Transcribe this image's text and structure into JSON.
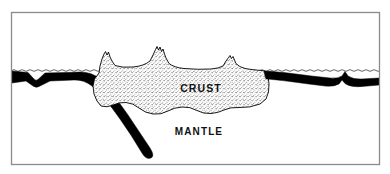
{
  "figure": {
    "background_color": "#ffffff",
    "frame": {
      "name": "outer-frame",
      "stroke_color": "#8a8a8a",
      "fill_color": "#ffffff",
      "x": 11,
      "y": 12,
      "width": 369,
      "height": 153
    },
    "labels": {
      "crust": "CRUST",
      "mantle": "MANTLE"
    },
    "sea_level": {
      "name": "sea-level-line",
      "y": 70,
      "style": "wavy",
      "color": "#444444"
    },
    "layers": {
      "crust": {
        "name": "continental-crust",
        "fill": "#ffffff",
        "stipple_color": "#333333",
        "outline_color": "#000000"
      },
      "oceanic_plate": {
        "name": "oceanic-plate",
        "fill": "#000000"
      },
      "mantle": {
        "name": "mantle-region",
        "fill": "#ffffff"
      }
    },
    "features": [
      {
        "name": "mountain-peak-left",
        "x": 105,
        "y": 52
      },
      {
        "name": "mountain-peak-center",
        "x": 158,
        "y": 48
      },
      {
        "name": "mountain-peak-right",
        "x": 230,
        "y": 58
      },
      {
        "name": "mid-ocean-ridge-left",
        "x": 36,
        "y": 80
      },
      {
        "name": "mid-ocean-ridge-right",
        "x": 345,
        "y": 72
      },
      {
        "name": "subduction-slab",
        "x": 150,
        "y": 155
      }
    ]
  }
}
